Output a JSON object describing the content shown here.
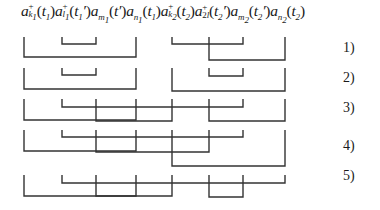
{
  "formula": {
    "operators": [
      {
        "base": "a",
        "sup": "+",
        "sub": "k",
        "subsub": "1",
        "arg": "t",
        "argsub": "1",
        "prime": ""
      },
      {
        "base": "a",
        "sup": "+",
        "sub": "l",
        "subsub": "1",
        "arg": "t",
        "argsub": "1",
        "prime": "′"
      },
      {
        "base": "a",
        "sup": "",
        "sub": "m",
        "subsub": "1",
        "arg": "t",
        "argsub": "",
        "prime": "′"
      },
      {
        "base": "a",
        "sup": "",
        "sub": "n",
        "subsub": "1",
        "arg": "t",
        "argsub": "1",
        "prime": ""
      },
      {
        "base": "a",
        "sup": "+",
        "sub": "k",
        "subsub": "2",
        "arg": "t",
        "argsub": "2",
        "prime": ""
      },
      {
        "base": "a",
        "sup": "+",
        "sub": "2",
        "subsub": "l",
        "arg": "t",
        "argsub": "2",
        "prime": "′"
      },
      {
        "base": "a",
        "sup": "",
        "sub": "m",
        "subsub": "2",
        "arg": "t",
        "argsub": "2",
        "prime": "′"
      },
      {
        "base": "a",
        "sup": "",
        "sub": "n",
        "subsub": "2",
        "arg": "t",
        "argsub": "2",
        "prime": ""
      }
    ],
    "text": "a⁺_{k1}(t1) a⁺_{l1}(t′1) a_{m1}(t′) a_{n1}(t1) a⁺_{k2}(t2) a⁺_{2l}(t′2) a_{m2}(t′2) a_{n2}(t2)"
  },
  "operator_x_positions": [
    24,
    62,
    96,
    136,
    172,
    209,
    243,
    285
  ],
  "contractions": [
    {
      "label": "1)",
      "pairs": [
        {
          "from": 0,
          "to": 3,
          "y": 57
        },
        {
          "from": 1,
          "to": 2,
          "y": 44
        },
        {
          "from": 4,
          "to": 6,
          "y": 44
        },
        {
          "from": 5,
          "to": 7,
          "y": 60
        }
      ]
    },
    {
      "label": "2)",
      "pairs": [
        {
          "from": 0,
          "to": 3,
          "y": 89
        },
        {
          "from": 1,
          "to": 2,
          "y": 75
        },
        {
          "from": 4,
          "to": 7,
          "y": 91
        },
        {
          "from": 5,
          "to": 6,
          "y": 76
        }
      ]
    },
    {
      "label": "3)",
      "pairs": [
        {
          "from": 0,
          "to": 3,
          "y": 120
        },
        {
          "from": 1,
          "to": 6,
          "y": 107
        },
        {
          "from": 2,
          "to": 4,
          "y": 121
        },
        {
          "from": 5,
          "to": 7,
          "y": 121
        }
      ]
    },
    {
      "label": "4)",
      "pairs": [
        {
          "from": 0,
          "to": 3,
          "y": 151
        },
        {
          "from": 1,
          "to": 6,
          "y": 137
        },
        {
          "from": 2,
          "to": 5,
          "y": 152
        },
        {
          "from": 4,
          "to": 7,
          "y": 166
        }
      ]
    },
    {
      "label": "5)",
      "pairs": [
        {
          "from": 0,
          "to": 3,
          "y": 196
        },
        {
          "from": 1,
          "to": 7,
          "y": 183
        },
        {
          "from": 2,
          "to": 4,
          "y": 196
        },
        {
          "from": 5,
          "to": 6,
          "y": 197
        }
      ]
    }
  ],
  "row_tick_tops": [
    37,
    68,
    99,
    130,
    175
  ],
  "labels": [
    "1)",
    "2)",
    "3)",
    "4)",
    "5)"
  ],
  "colors": {
    "line": "#333333",
    "text": "#1a1a1a",
    "background": "#ffffff"
  }
}
